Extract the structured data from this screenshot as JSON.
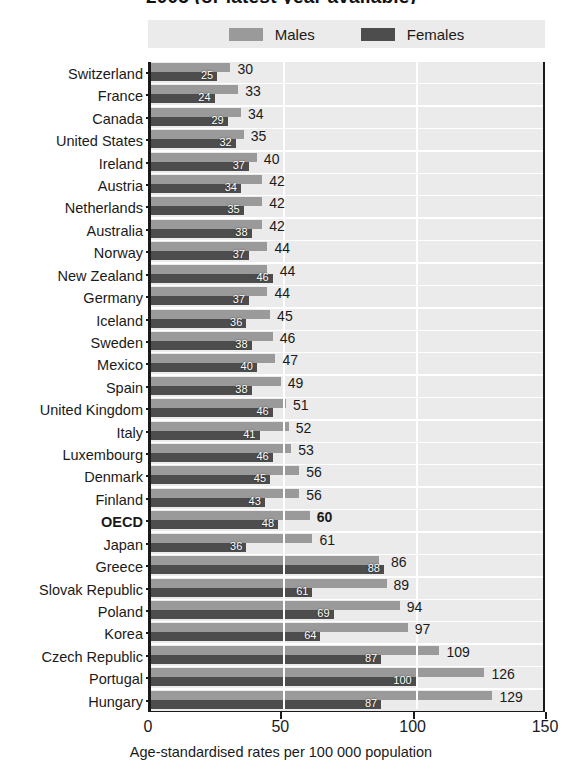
{
  "chart_data": {
    "type": "bar",
    "orientation": "horizontal",
    "title": "2005 (or latest year available)",
    "xlabel": "Age-standardised rates per 100 000 population",
    "ylabel": "",
    "xlim": [
      0,
      150
    ],
    "xticks": [
      0,
      50,
      100,
      150
    ],
    "grid": true,
    "legend_position": "top",
    "highlight_category": "OECD",
    "colors": {
      "males": "#9a9a9a",
      "females": "#4d4d4d",
      "band": "#ebebeb",
      "axis": "#1a1a1a"
    },
    "categories": [
      "Switzerland",
      "France",
      "Canada",
      "United States",
      "Ireland",
      "Austria",
      "Netherlands",
      "Australia",
      "Norway",
      "New Zealand",
      "Germany",
      "Iceland",
      "Sweden",
      "Mexico",
      "Spain",
      "United Kingdom",
      "Italy",
      "Luxembourg",
      "Denmark",
      "Finland",
      "OECD",
      "Japan",
      "Greece",
      "Slovak Republic",
      "Poland",
      "Korea",
      "Czech Republic",
      "Portugal",
      "Hungary"
    ],
    "series": [
      {
        "name": "Males",
        "color": "#9a9a9a",
        "values": [
          30,
          33,
          34,
          35,
          40,
          42,
          42,
          42,
          44,
          44,
          44,
          45,
          46,
          47,
          49,
          51,
          52,
          53,
          56,
          56,
          60,
          61,
          86,
          89,
          94,
          97,
          109,
          126,
          129
        ]
      },
      {
        "name": "Females",
        "color": "#4d4d4d",
        "values": [
          25,
          24,
          29,
          32,
          37,
          34,
          35,
          38,
          37,
          46,
          37,
          36,
          38,
          40,
          38,
          46,
          41,
          46,
          45,
          43,
          48,
          36,
          88,
          61,
          69,
          64,
          87,
          100,
          87
        ]
      }
    ]
  },
  "legend": {
    "items": [
      {
        "label": "Males",
        "swatch": "males-swatch"
      },
      {
        "label": "Females",
        "swatch": "females-swatch"
      }
    ]
  },
  "axis": {
    "x_title": "Age-standardised rates per 100 000 population",
    "x_tick_labels": [
      "0",
      "50",
      "100",
      "150"
    ]
  }
}
